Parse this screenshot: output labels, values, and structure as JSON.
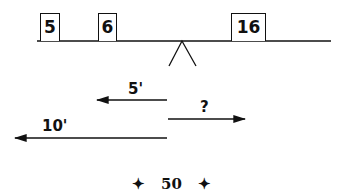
{
  "diagram": {
    "weights": [
      {
        "label": "5",
        "x": 40,
        "w": 20
      },
      {
        "label": "6",
        "x": 98,
        "w": 19
      },
      {
        "label": "16",
        "x": 231,
        "w": 35
      }
    ],
    "arrows": [
      {
        "label": "5'",
        "direction": "left"
      },
      {
        "label": "?",
        "direction": "right"
      },
      {
        "label": "10'",
        "direction": "left"
      }
    ],
    "page_number": "50",
    "ornament": "✦"
  }
}
